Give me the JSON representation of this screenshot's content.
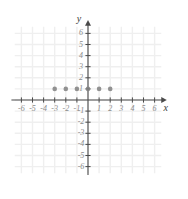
{
  "figure": {
    "kind": "coordinate-plane",
    "background_color": "#ffffff",
    "grid_color": "#efefef",
    "axis_color": "#4a4a4a",
    "tick_label_color": "#8a8a8a",
    "point_color": "#808080"
  },
  "axes": {
    "x": {
      "name": "x",
      "min": -7,
      "max": 7,
      "tick_values": [
        -6,
        -5,
        -4,
        -3,
        -2,
        -1,
        1,
        2,
        3,
        4,
        5,
        6
      ],
      "tick_labels": [
        "-6",
        "-5",
        "-4",
        "-3",
        "-2",
        "-1",
        "1",
        "2",
        "3",
        "4",
        "5",
        "6"
      ],
      "arrow": true
    },
    "y": {
      "name": "y",
      "min": -7,
      "max": 7,
      "tick_values": [
        6,
        5,
        4,
        3,
        2,
        1,
        -1,
        -2,
        -3,
        -4,
        -5,
        -6
      ],
      "tick_labels": [
        "6",
        "5",
        "4",
        "3",
        "2",
        "1",
        "-1",
        "-2",
        "-3",
        "-4",
        "-5",
        "-6"
      ],
      "arrow": true
    }
  },
  "chart_data": {
    "type": "scatter",
    "title": "",
    "xlabel": "x",
    "ylabel": "y",
    "xlim": [
      -7,
      7
    ],
    "ylim": [
      -7,
      7
    ],
    "grid": true,
    "legend": null,
    "series": [
      {
        "name": "plotted-points",
        "color": "#808080",
        "marker": "filled-circle",
        "points": [
          {
            "x": -3,
            "y": 1
          },
          {
            "x": -2,
            "y": 1
          },
          {
            "x": -1,
            "y": 1
          },
          {
            "x": 0,
            "y": 1
          },
          {
            "x": 1,
            "y": 1
          },
          {
            "x": 2,
            "y": 1
          }
        ],
        "x": [
          -3,
          -2,
          -1,
          0,
          1,
          2
        ],
        "y": [
          1,
          1,
          1,
          1,
          1,
          1
        ]
      }
    ],
    "annotations": []
  }
}
